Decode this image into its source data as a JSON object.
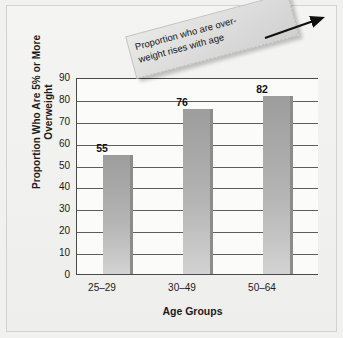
{
  "chart_data": {
    "type": "bar",
    "title": "",
    "categories": [
      "25–29",
      "30–49",
      "50–64"
    ],
    "values": [
      55,
      76,
      82
    ],
    "xlabel": "Age Groups",
    "ylabel": "Proportion Who Are 5% or More Overweight",
    "ylabel_lines": [
      "Proportion Who Are 5% or More",
      "Overweight"
    ],
    "ylim": [
      0,
      90
    ],
    "ytick_values": [
      90,
      80,
      70,
      60,
      50,
      40,
      30,
      20,
      10,
      0
    ],
    "ytick_labels": [
      "90",
      "80",
      "70",
      "60",
      "50",
      "40",
      "30",
      "20",
      "10",
      "0"
    ],
    "grid": true,
    "legend": "none",
    "bar_color": "#b4b4b4",
    "bar_edge_color": "#8c8c8c",
    "grid_color": "#5d5d5d",
    "axis_color": "#4a4a4a",
    "plot_background": "#fbfbfa",
    "figure_background": "#f1f1ef",
    "annotations": [
      {
        "text": "Proportion who are over-weight rises with age",
        "lines": [
          "Proportion who are over-",
          "weight rises with age"
        ],
        "rotation_deg": -15,
        "has_arrow": true,
        "arrow_direction": "up-right",
        "box_color": "#dedede"
      }
    ],
    "data_labels": [
      "55",
      "76",
      "82"
    ]
  }
}
